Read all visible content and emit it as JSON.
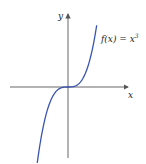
{
  "chart_data": {
    "type": "line",
    "title": "",
    "xlabel": "x",
    "ylabel": "y",
    "series": [
      {
        "name": "f(x) = x^3",
        "function": "x^3",
        "color": "#3a55b0"
      }
    ],
    "annotations": [
      {
        "text": "f(x) = x",
        "superscript": "3"
      }
    ],
    "grid": false,
    "legend": "none"
  },
  "labels": {
    "x_axis": "x",
    "y_axis": "y",
    "func_text": "f(x) = x",
    "func_sup": "3"
  },
  "colors": {
    "curve": "#3a55b0",
    "axis": "#555555"
  }
}
